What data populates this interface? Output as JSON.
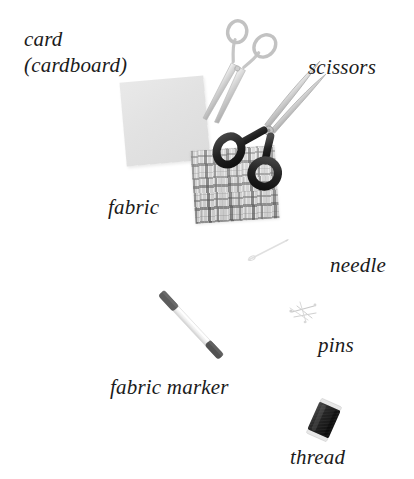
{
  "scene": {
    "title": "Sewing materials and equipment",
    "background_color": "#ffffff",
    "width": 414,
    "height": 479
  },
  "labels": [
    {
      "id": "card",
      "text": "card",
      "x": 24,
      "y": 28,
      "align": "left"
    },
    {
      "id": "cardboard",
      "text": "(cardboard)",
      "x": 24,
      "y": 54,
      "align": "left"
    },
    {
      "id": "scissors",
      "text": "scissors",
      "x": 308,
      "y": 56,
      "align": "left"
    },
    {
      "id": "fabric",
      "text": "fabric",
      "x": 108,
      "y": 196,
      "align": "left"
    },
    {
      "id": "needle",
      "text": "needle",
      "x": 330,
      "y": 254,
      "align": "left"
    },
    {
      "id": "pins",
      "text": "pins",
      "x": 318,
      "y": 334,
      "align": "left"
    },
    {
      "id": "fabric_marker",
      "text": "fabric marker",
      "x": 110,
      "y": 376,
      "align": "left"
    },
    {
      "id": "thread",
      "text": "thread",
      "x": 290,
      "y": 446,
      "align": "left"
    }
  ],
  "objects": [
    {
      "id": "card-swatch",
      "name": "card (cardboard)",
      "color": "#e3e3e3",
      "shape": "rotated-square"
    },
    {
      "id": "fabric-swatch",
      "name": "fabric",
      "color": "#d2d2d2",
      "shape": "plaid-square"
    },
    {
      "id": "small-scissors",
      "name": "small scissors",
      "color": "#c9c9c9",
      "shape": "embroidery-scissors"
    },
    {
      "id": "dressmaker-shears",
      "name": "dressmaking shears",
      "color": "#2b2b2b",
      "shape": "shears"
    },
    {
      "id": "needle-object",
      "name": "needle",
      "color": "#dcdcdc",
      "shape": "thin-needle"
    },
    {
      "id": "pins-object",
      "name": "pins",
      "color": "#bdbdbd",
      "shape": "pin-cluster"
    },
    {
      "id": "fabric-marker",
      "name": "fabric marker pen",
      "color": "#f2f2f2",
      "shape": "pen"
    },
    {
      "id": "thread-spool",
      "name": "thread spool",
      "color": "#2e2e2e",
      "shape": "spool"
    }
  ],
  "colors": {
    "text": "#1b1b1b",
    "card": "#e3e3e3",
    "fabric": "#d2d2d2",
    "metal": "#c9c9c9",
    "handle_black": "#2b2b2b",
    "thread_dark": "#2e2e2e",
    "background": "#ffffff"
  }
}
